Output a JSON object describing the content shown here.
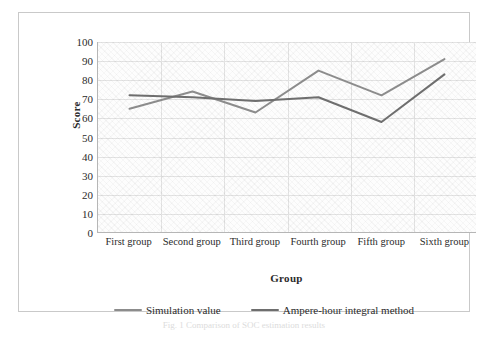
{
  "chart_data": {
    "type": "line",
    "title": "",
    "xlabel": "Group",
    "ylabel": "Score",
    "categories": [
      "First group",
      "Second group",
      "Third group",
      "Fourth group",
      "Fifth group",
      "Sixth group"
    ],
    "ylim": [
      0,
      100
    ],
    "yticks": [
      100,
      90,
      80,
      70,
      60,
      50,
      40,
      30,
      20,
      10,
      0
    ],
    "grid": true,
    "legend_position": "bottom",
    "series": [
      {
        "name": "Simulation value",
        "color": "#8c8c8c",
        "values": [
          65,
          74,
          63,
          85,
          72,
          91
        ]
      },
      {
        "name": "Ampere-hour integral method",
        "color": "#6e6e6e",
        "values": [
          72,
          71,
          69,
          71,
          58,
          83
        ]
      }
    ]
  },
  "axes": {
    "y_title": "Score",
    "x_title": "Group"
  },
  "caption": {
    "text": "Fig. 1  Comparison of SOC estimation results"
  }
}
